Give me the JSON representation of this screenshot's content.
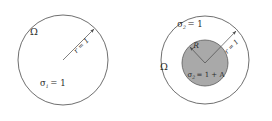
{
  "figure": {
    "panels": [
      {
        "id": "left-panel",
        "name": "homogeneous-disk",
        "domain_label": "Ω",
        "radius_label": "r = 1",
        "conductivity_label_symbol": "σ",
        "conductivity_label_sub": "1",
        "conductivity_label_rest": "= 1",
        "conductivity_label_full": "σ1 = 1",
        "outer_circle": {
          "cx": 63,
          "cy": 60,
          "r": 45,
          "fill": "#ffffff",
          "stroke": "#4a4a4a"
        },
        "radius_arrow": {
          "x1": 63,
          "y1": 60,
          "x2": 95,
          "y2": 28
        }
      },
      {
        "id": "right-panel",
        "name": "disk-with-inclusion",
        "domain_label": "Ω",
        "outer_conductivity_symbol": "σ",
        "outer_conductivity_sub": "2",
        "outer_conductivity_rest": "= 1",
        "outer_conductivity_full": "σ2 = 1",
        "inclusion_radius_label": "R",
        "radius_label": "r = 1",
        "inner_conductivity_symbol": "σ",
        "inner_conductivity_sub": "2",
        "inner_conductivity_rest": "= 1 + A",
        "inner_conductivity_full": "σ2 = 1 + A",
        "outer_circle": {
          "cx": 205,
          "cy": 60,
          "r": 44,
          "fill": "#ffffff",
          "stroke": "#4a4a4a"
        },
        "inner_circle": {
          "cx": 205,
          "cy": 63,
          "r": 23,
          "fill": "#a9a9a9",
          "stroke": "#5a5a5a"
        },
        "inclusion_arrow": {
          "x1": 205,
          "y1": 63,
          "x2": 189,
          "y2": 46
        },
        "radius_arrow": {
          "x1": 205,
          "y1": 63,
          "x2": 237,
          "y2": 30
        }
      }
    ],
    "colors": {
      "background": "#ffffff",
      "stroke": "#4a4a4a",
      "inclusion_fill": "#a9a9a9",
      "text": "#2b2b2b"
    }
  }
}
